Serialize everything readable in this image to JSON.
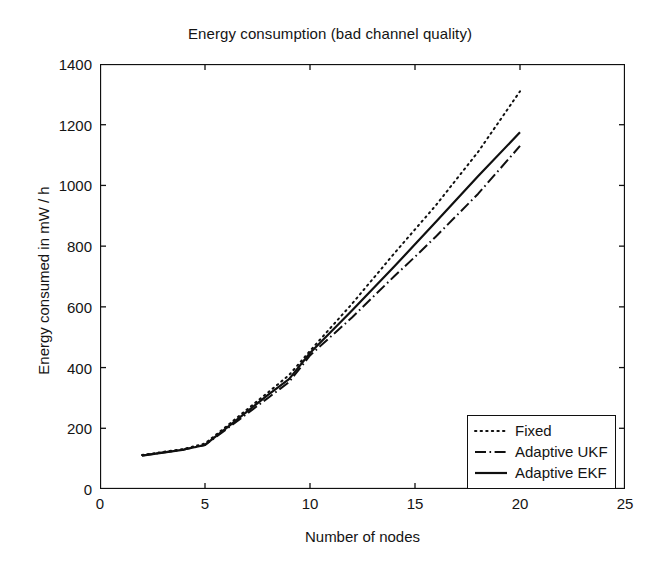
{
  "chart_data": {
    "type": "line",
    "title": "Energy consumption (bad channel quality)",
    "xlabel": "Number of nodes",
    "ylabel": "Energy consumed in mW / h",
    "xlim": [
      0,
      25
    ],
    "ylim": [
      0,
      1400
    ],
    "xticks": [
      0,
      5,
      10,
      15,
      20,
      25
    ],
    "yticks": [
      0,
      200,
      400,
      600,
      800,
      1000,
      1200,
      1400
    ],
    "xtick_labels": [
      "0",
      "5",
      "10",
      "15",
      "20",
      "25"
    ],
    "ytick_labels": [
      "0",
      "200",
      "400",
      "600",
      "800",
      "1000",
      "1200",
      "1400"
    ],
    "grid": false,
    "legend_position": "lower right",
    "x": [
      2,
      3,
      4,
      5,
      6,
      7,
      8,
      9,
      10,
      12,
      14,
      15,
      16,
      18,
      20
    ],
    "series": [
      {
        "name": "Fixed",
        "linestyle": "dotted",
        "color": "#101010",
        "values": [
          112,
          122,
          132,
          150,
          205,
          262,
          318,
          375,
          455,
          610,
          775,
          855,
          935,
          1110,
          1310
        ]
      },
      {
        "name": "Adaptive UKF",
        "linestyle": "dashdot",
        "color": "#101010",
        "values": [
          110,
          120,
          130,
          145,
          196,
          248,
          300,
          352,
          440,
          565,
          700,
          765,
          832,
          972,
          1130
        ]
      },
      {
        "name": "Adaptive EKF",
        "linestyle": "solid",
        "color": "#101010",
        "values": [
          110,
          120,
          130,
          145,
          200,
          255,
          310,
          362,
          448,
          588,
          732,
          806,
          880,
          1030,
          1175
        ]
      }
    ]
  }
}
